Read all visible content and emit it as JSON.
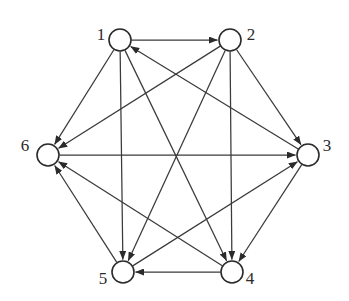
{
  "diagram": {
    "type": "directed-graph",
    "background_color": "#ffffff",
    "edge_color": "#3a3a3a",
    "node_fill": "#ffffff",
    "node_stroke": "#2b2b2b",
    "label_color": "#2b2b2b",
    "node_radius": 11,
    "nodes": [
      {
        "id": "1",
        "label": "1",
        "x": 120,
        "y": 40,
        "label_x": 101,
        "label_y": 36
      },
      {
        "id": "2",
        "label": "2",
        "x": 230,
        "y": 40,
        "label_x": 251,
        "label_y": 36
      },
      {
        "id": "3",
        "label": "3",
        "x": 308,
        "y": 155,
        "label_x": 327,
        "label_y": 147
      },
      {
        "id": "4",
        "label": "4",
        "x": 232,
        "y": 272,
        "label_x": 250,
        "label_y": 280
      },
      {
        "id": "5",
        "label": "5",
        "x": 123,
        "y": 272,
        "label_x": 103,
        "label_y": 280
      },
      {
        "id": "6",
        "label": "6",
        "x": 48,
        "y": 155,
        "label_x": 25,
        "label_y": 147
      }
    ],
    "edges": [
      {
        "from": "1",
        "to": "2",
        "name": "edge-1-2"
      },
      {
        "from": "1",
        "to": "6",
        "name": "edge-1-6"
      },
      {
        "from": "1",
        "to": "5",
        "name": "edge-1-5"
      },
      {
        "from": "1",
        "to": "4",
        "name": "edge-1-4"
      },
      {
        "from": "2",
        "to": "3",
        "name": "edge-2-3"
      },
      {
        "from": "2",
        "to": "6",
        "name": "edge-2-6"
      },
      {
        "from": "2",
        "to": "4",
        "name": "edge-2-4"
      },
      {
        "from": "2",
        "to": "5",
        "name": "edge-2-5"
      },
      {
        "from": "3",
        "to": "1",
        "name": "edge-3-1"
      },
      {
        "from": "3",
        "to": "4",
        "name": "edge-3-4"
      },
      {
        "from": "4",
        "to": "5",
        "name": "edge-4-5"
      },
      {
        "from": "4",
        "to": "6",
        "name": "edge-4-6"
      },
      {
        "from": "5",
        "to": "3",
        "name": "edge-5-3"
      },
      {
        "from": "5",
        "to": "6",
        "name": "edge-5-6"
      },
      {
        "from": "6",
        "to": "3",
        "name": "edge-6-3"
      }
    ]
  }
}
